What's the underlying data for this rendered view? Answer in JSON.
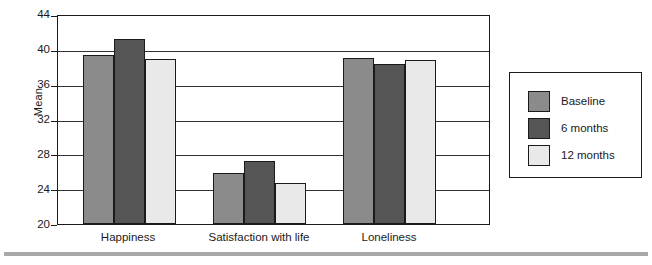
{
  "chart_data": {
    "type": "bar",
    "title": "",
    "xlabel": "",
    "ylabel": "Mean",
    "categories": [
      "Happiness",
      "Satisfaction with life",
      "Loneliness"
    ],
    "series": [
      {
        "name": "Baseline",
        "color": "#8b8b8b",
        "values": [
          39.4,
          25.9,
          39.1
        ]
      },
      {
        "name": "6 months",
        "color": "#555555",
        "values": [
          41.2,
          27.2,
          38.3
        ]
      },
      {
        "name": "12 months",
        "color": "#e9e9e9",
        "values": [
          38.9,
          24.7,
          38.8
        ]
      }
    ],
    "ylim": [
      20,
      44
    ],
    "yticks": [
      20,
      24,
      28,
      32,
      36,
      40,
      44
    ],
    "ytick_labels": [
      "20",
      "24",
      "28",
      "32",
      "36",
      "40",
      "44"
    ],
    "grid": "horizontal",
    "legend_position": "right-outside"
  },
  "legend": {
    "entries": [
      {
        "label": "Baseline",
        "color": "#8b8b8b"
      },
      {
        "label": "6 months",
        "color": "#555555"
      },
      {
        "label": "12 months",
        "color": "#e9e9e9"
      }
    ]
  },
  "footer": {
    "caption": ""
  }
}
